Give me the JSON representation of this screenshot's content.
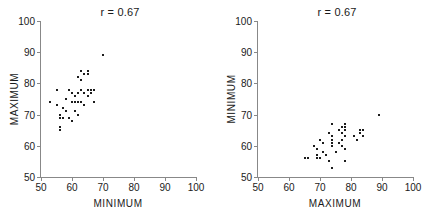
{
  "figure": {
    "background": "#ffffff",
    "point_color": "#1c1c1c",
    "axis_color": "#888888"
  },
  "panels": [
    {
      "name": "left",
      "title": "r = 0.67",
      "xlabel": "MINIMUM",
      "ylabel": "MAXIMUM"
    },
    {
      "name": "right",
      "title": "r = 0.67",
      "xlabel": "MAXIMUM",
      "ylabel": "MINIMUM"
    }
  ],
  "chart_data": [
    {
      "type": "scatter",
      "title": "r = 0.67",
      "xlabel": "MINIMUM",
      "ylabel": "MAXIMUM",
      "xlim": [
        50,
        100
      ],
      "ylim": [
        50,
        100
      ],
      "xticks": [
        50,
        60,
        70,
        80,
        90,
        100
      ],
      "yticks": [
        50,
        60,
        70,
        80,
        90,
        100
      ],
      "grid": false,
      "legend": "none",
      "correlation": 0.67,
      "annotations": [
        "r = 0.67"
      ],
      "x": [
        53,
        55,
        55,
        56,
        56,
        56,
        56,
        57,
        57,
        58,
        58,
        59,
        59,
        60,
        60,
        60,
        61,
        61,
        61,
        62,
        62,
        62,
        62,
        63,
        63,
        63,
        63,
        64,
        64,
        64,
        65,
        65,
        65,
        65,
        66,
        66,
        67,
        67,
        70
      ],
      "y": [
        74,
        78,
        73,
        70,
        69,
        66,
        65,
        72,
        69,
        75,
        71,
        78,
        69,
        77,
        74,
        68,
        76,
        74,
        71,
        82,
        77,
        74,
        70,
        84,
        81,
        78,
        74,
        83,
        77,
        73,
        84,
        83,
        78,
        76,
        78,
        77,
        78,
        74,
        89
      ]
    },
    {
      "type": "scatter",
      "title": "r = 0.67",
      "xlabel": "MAXIMUM",
      "ylabel": "MINIMUM",
      "xlim": [
        50,
        100
      ],
      "ylim": [
        50,
        100
      ],
      "xticks": [
        50,
        60,
        70,
        80,
        90,
        100
      ],
      "yticks": [
        50,
        60,
        70,
        80,
        90,
        100
      ],
      "grid": false,
      "legend": "none",
      "correlation": 0.67,
      "annotations": [
        "r = 0.67"
      ],
      "x": [
        74,
        78,
        73,
        70,
        69,
        66,
        65,
        72,
        69,
        75,
        71,
        78,
        69,
        77,
        74,
        68,
        76,
        74,
        71,
        82,
        77,
        74,
        70,
        84,
        81,
        78,
        74,
        83,
        77,
        73,
        84,
        83,
        78,
        76,
        78,
        77,
        78,
        74,
        89
      ],
      "y": [
        53,
        55,
        55,
        56,
        56,
        56,
        56,
        57,
        57,
        58,
        58,
        59,
        59,
        60,
        60,
        60,
        61,
        61,
        61,
        62,
        62,
        62,
        62,
        63,
        63,
        63,
        63,
        64,
        64,
        64,
        65,
        65,
        65,
        65,
        66,
        66,
        67,
        67,
        70
      ]
    }
  ]
}
